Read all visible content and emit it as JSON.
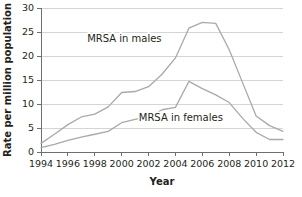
{
  "chart_data": {
    "type": "line",
    "title": "",
    "xlabel": "Year",
    "ylabel": "Rate per million population",
    "xlim": [
      1994,
      2012
    ],
    "ylim": [
      0,
      30
    ],
    "grid": true,
    "legend_position": "inline-annotations",
    "x": [
      1994,
      1995,
      1996,
      1997,
      1998,
      1999,
      2000,
      2001,
      2002,
      2003,
      2004,
      2005,
      2006,
      2007,
      2008,
      2009,
      2010,
      2011,
      2012
    ],
    "xticks": [
      1994,
      1996,
      1998,
      2000,
      2002,
      2004,
      2006,
      2008,
      2010,
      2012
    ],
    "xtick_labels": [
      "1994",
      "1996",
      "1998",
      "2000",
      "2002",
      "2004",
      "2006",
      "2008",
      "2010",
      "2012"
    ],
    "yticks": [
      0,
      5,
      10,
      15,
      20,
      25,
      30
    ],
    "ytick_labels": [
      "0",
      "5",
      "10",
      "15",
      "20",
      "25",
      "30"
    ],
    "series": [
      {
        "name": "MRSA in males",
        "label": "MRSA in males",
        "color": "#a7a9ac",
        "values": [
          1.8,
          3.7,
          5.7,
          7.3,
          7.9,
          9.4,
          12.4,
          12.6,
          13.6,
          16.2,
          19.6,
          25.8,
          27.0,
          26.8,
          21.3,
          14.4,
          7.5,
          5.5,
          4.3
        ]
      },
      {
        "name": "MRSA in females",
        "label": "MRSA in females",
        "color": "#a7a9ac",
        "values": [
          0.9,
          1.6,
          2.4,
          3.1,
          3.7,
          4.3,
          6.1,
          6.8,
          7.3,
          8.8,
          9.3,
          14.7,
          13.2,
          11.9,
          10.3,
          7.0,
          4.1,
          2.6,
          2.6
        ]
      }
    ],
    "annotations": [
      {
        "text": "MRSA in males",
        "x": 2000.2,
        "y": 23.0
      },
      {
        "text": "MRSA in females",
        "x": 2004.4,
        "y": 6.4
      }
    ]
  }
}
